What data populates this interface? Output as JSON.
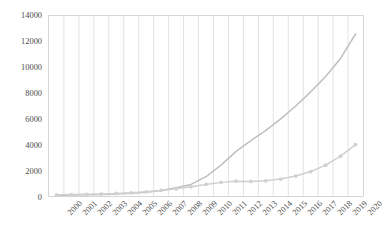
{
  "legend": {
    "position": "top-center",
    "entries": [
      {
        "label": "C-suite",
        "color": "#bfbfbf",
        "marker": false
      },
      {
        "label": "CXO or CXOs",
        "color": "#d0d0d0",
        "marker": true
      }
    ]
  },
  "axes": {
    "y_ticks": [
      "0",
      "2000",
      "4000",
      "6000",
      "8000",
      "10000",
      "12000",
      "14000"
    ],
    "x_ticks": [
      "2000",
      "2001",
      "2002",
      "2003",
      "2004",
      "2005",
      "2006",
      "2007",
      "2008",
      "2009",
      "2010",
      "2011",
      "2012",
      "2013",
      "2014",
      "2015",
      "2016",
      "2017",
      "2018",
      "2019",
      "2020"
    ]
  },
  "colors": {
    "plot_border": "#d6d6d6",
    "gridline": "#e2e2e2",
    "series_c_suite": "#bfbfbf",
    "series_cxo": "#d0d0d0",
    "text": "#4d4d4d"
  },
  "chart_data": {
    "type": "line",
    "title": "",
    "subtitle": "",
    "xlabel": "",
    "ylabel": "",
    "ylim": [
      0,
      14000
    ],
    "ytick_step": 2000,
    "grid": "vertical",
    "legend_position": "top-center",
    "categories": [
      "2000",
      "2001",
      "2002",
      "2003",
      "2004",
      "2005",
      "2006",
      "2007",
      "2008",
      "2009",
      "2010",
      "2011",
      "2012",
      "2013",
      "2014",
      "2015",
      "2016",
      "2017",
      "2018",
      "2019",
      "2020"
    ],
    "series": [
      {
        "name": "C-suite",
        "color": "#bfbfbf",
        "markers": false,
        "values": [
          60,
          75,
          95,
          120,
          160,
          210,
          300,
          430,
          640,
          900,
          1500,
          2400,
          3450,
          4300,
          5100,
          6000,
          7000,
          8100,
          9300,
          10700,
          12600
        ]
      },
      {
        "name": "CXO or CXOs",
        "color": "#d0d0d0",
        "markers": true,
        "values": [
          90,
          110,
          130,
          160,
          200,
          250,
          330,
          430,
          560,
          720,
          900,
          1060,
          1150,
          1130,
          1180,
          1320,
          1550,
          1900,
          2400,
          3100,
          4000
        ]
      }
    ]
  }
}
